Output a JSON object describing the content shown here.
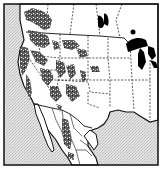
{
  "map": {
    "type": "range-map",
    "region": "Western North America",
    "colors": {
      "ocean": "#dcdcdc",
      "land": "#ffffff",
      "border": "#111111",
      "range": "#3a3a3a",
      "lakes": "#000000"
    },
    "layers": [
      {
        "name": "ocean",
        "style": "stippled gray"
      },
      {
        "name": "land",
        "style": "white"
      },
      {
        "name": "national-borders",
        "style": "solid black line"
      },
      {
        "name": "state-borders",
        "style": "dashed black line"
      },
      {
        "name": "great-lakes",
        "style": "solid black fill"
      },
      {
        "name": "species-range",
        "style": "dark speckled patches across western mountains"
      }
    ],
    "labels": []
  }
}
